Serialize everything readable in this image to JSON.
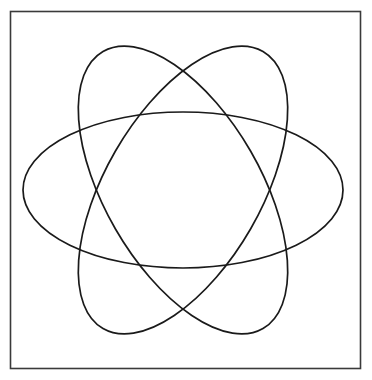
{
  "figure": {
    "background_color": "#ffffff",
    "width": 372,
    "height": 380
  },
  "frame": {
    "name": "outer-border-frame",
    "x": 10.5,
    "y": 11.5,
    "width": 350,
    "height": 357,
    "stroke_color": "#3a3a3a",
    "stroke_width": 1.6
  },
  "chart_data": {
    "type": "scatter",
    "subtitle": "",
    "xlabel": "",
    "ylabel": "",
    "grid": false,
    "legend": "none",
    "xlim": [
      0,
      372
    ],
    "ylim": [
      0,
      380
    ],
    "center": {
      "x": 183,
      "y": 190
    },
    "shape": "ellipse",
    "semi_axis_major": 160,
    "semi_axis_minor": 78,
    "rotations_deg": [
      0,
      60,
      120
    ],
    "stroke_color": "#1a1a1a",
    "stroke_width": 1.7,
    "series": [
      {
        "name": "ellipse-horizontal",
        "rotation_deg": 0,
        "rx": 160,
        "ry": 78,
        "cx": 183,
        "cy": 190,
        "extent_left_x": 23,
        "extent_right_x": 343,
        "extent_top_y": 112,
        "extent_bottom_y": 268
      },
      {
        "name": "ellipse-tilted-right",
        "rotation_deg": 60,
        "rx": 160,
        "ry": 78,
        "cx": 183,
        "cy": 190,
        "extent_left_x": 73,
        "extent_right_x": 293,
        "extent_top_y": 42,
        "extent_bottom_y": 338
      },
      {
        "name": "ellipse-tilted-left",
        "rotation_deg": 120,
        "rx": 160,
        "ry": 78,
        "cx": 183,
        "cy": 190,
        "extent_left_x": 73,
        "extent_right_x": 293,
        "extent_top_y": 42,
        "extent_bottom_y": 338
      }
    ],
    "annotations": [
      {
        "name": "crossing-top",
        "x": 183,
        "y": 64
      },
      {
        "name": "crossing-bottom",
        "x": 183,
        "y": 315
      }
    ]
  }
}
